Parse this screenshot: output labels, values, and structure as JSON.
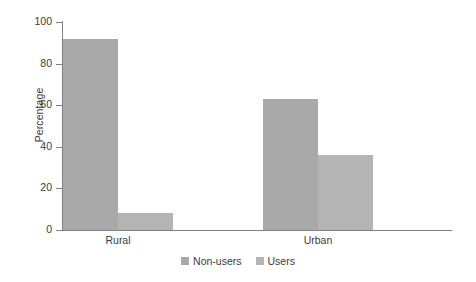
{
  "chart_data": {
    "type": "bar",
    "title": "",
    "subtitle": "",
    "xlabel": "",
    "ylabel": "Percentage",
    "categories": [
      "Rural",
      "Urban"
    ],
    "series": [
      {
        "name": "Non-users",
        "values": [
          92,
          63
        ],
        "color": "#a9a9a9"
      },
      {
        "name": "Users",
        "values": [
          8,
          36
        ],
        "color": "#b4b4b4"
      }
    ],
    "ylim": [
      0,
      100
    ],
    "yticks": [
      0,
      20,
      40,
      60,
      80,
      100
    ],
    "ytick_labels": [
      "0",
      "20",
      "40",
      "60",
      "80",
      "100"
    ],
    "grid": false,
    "legend_position": "bottom-center",
    "annotations": []
  },
  "axis": {
    "line_color": "#808080",
    "text_color": "#3b3b3b"
  },
  "legend": {
    "entries": [
      {
        "label": "Non-users",
        "color": "#a9a9a9"
      },
      {
        "label": "Users",
        "color": "#b4b4b4"
      }
    ]
  }
}
